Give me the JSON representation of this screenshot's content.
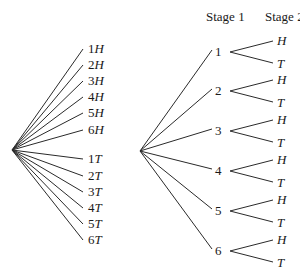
{
  "left_tree": {
    "outcomes": [
      {
        "num": "1",
        "letter": "H"
      },
      {
        "num": "2",
        "letter": "H"
      },
      {
        "num": "3",
        "letter": "H"
      },
      {
        "num": "4",
        "letter": "H"
      },
      {
        "num": "5",
        "letter": "H"
      },
      {
        "num": "6",
        "letter": "H"
      },
      {
        "num": "1",
        "letter": "T"
      },
      {
        "num": "2",
        "letter": "T"
      },
      {
        "num": "3",
        "letter": "T"
      },
      {
        "num": "4",
        "letter": "T"
      },
      {
        "num": "5",
        "letter": "T"
      },
      {
        "num": "6",
        "letter": "T"
      }
    ]
  },
  "right_tree": {
    "headers": {
      "stage1": "Stage 1",
      "stage2": "Stage 2"
    },
    "stage1_nodes": [
      "1",
      "2",
      "3",
      "4",
      "5",
      "6"
    ],
    "stage2_branches": [
      "H",
      "T"
    ]
  },
  "colors": {
    "line": "#2a2a2a",
    "text": "#1a1a1a",
    "background": "#ffffff"
  }
}
